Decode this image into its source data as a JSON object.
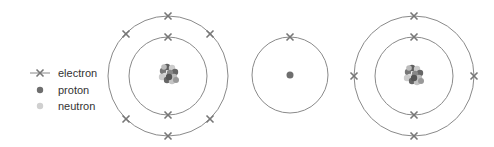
{
  "legend": {
    "items": [
      {
        "label": "electron",
        "icon": "cross-on-line"
      },
      {
        "label": "proton",
        "icon": "dark-gray-dot"
      },
      {
        "label": "neutron",
        "icon": "light-gray-dot"
      }
    ]
  },
  "atoms": [
    {
      "name": "atom-1",
      "shells": [
        2,
        6
      ],
      "electrons_total": 8,
      "nucleus": "cluster"
    },
    {
      "name": "atom-2",
      "shells": [
        1
      ],
      "electrons_total": 1,
      "nucleus": "single-proton"
    },
    {
      "name": "atom-3",
      "shells": [
        2,
        4
      ],
      "electrons_total": 6,
      "nucleus": "cluster"
    }
  ],
  "colors": {
    "ring": "#8a8a8a",
    "electron": "#7a7a7a",
    "proton": "#6e6e6e",
    "neutron": "#c8c8c8",
    "text": "#333333"
  }
}
